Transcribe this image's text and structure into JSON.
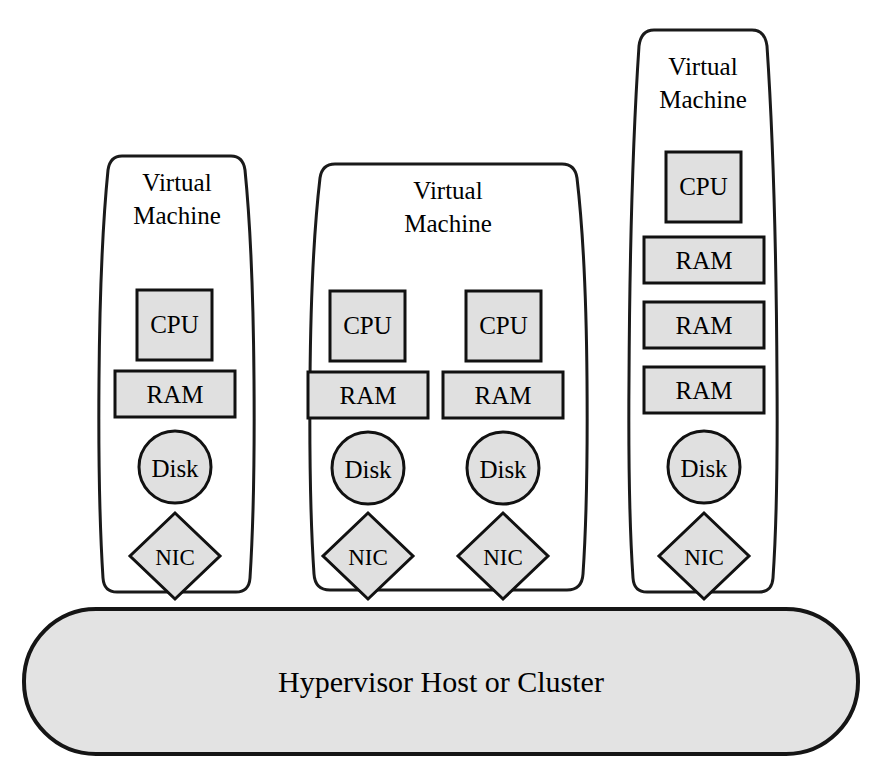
{
  "diagram": {
    "title_text": "Hypervisor Host or Cluster",
    "colors": {
      "component_fill": "#e0e0e0",
      "hypervisor_fill": "#e3e3e3",
      "stroke": "#111111",
      "background": "#ffffff"
    },
    "virtual_machines": [
      {
        "id": "vm-1",
        "title_line1": "Virtual",
        "title_line2": "Machine",
        "columns": [
          {
            "components": [
              {
                "type": "cpu",
                "label": "CPU",
                "shape": "rectangle"
              },
              {
                "type": "ram",
                "label": "RAM",
                "shape": "rectangle"
              },
              {
                "type": "disk",
                "label": "Disk",
                "shape": "circle"
              },
              {
                "type": "nic",
                "label": "NIC",
                "shape": "diamond"
              }
            ]
          }
        ]
      },
      {
        "id": "vm-2",
        "title_line1": "Virtual",
        "title_line2": "Machine",
        "columns": [
          {
            "components": [
              {
                "type": "cpu",
                "label": "CPU",
                "shape": "rectangle"
              },
              {
                "type": "ram",
                "label": "RAM",
                "shape": "rectangle"
              },
              {
                "type": "disk",
                "label": "Disk",
                "shape": "circle"
              },
              {
                "type": "nic",
                "label": "NIC",
                "shape": "diamond"
              }
            ]
          },
          {
            "components": [
              {
                "type": "cpu",
                "label": "CPU",
                "shape": "rectangle"
              },
              {
                "type": "ram",
                "label": "RAM",
                "shape": "rectangle"
              },
              {
                "type": "disk",
                "label": "Disk",
                "shape": "circle"
              },
              {
                "type": "nic",
                "label": "NIC",
                "shape": "diamond"
              }
            ]
          }
        ]
      },
      {
        "id": "vm-3",
        "title_line1": "Virtual",
        "title_line2": "Machine",
        "columns": [
          {
            "components": [
              {
                "type": "cpu",
                "label": "CPU",
                "shape": "rectangle"
              },
              {
                "type": "ram",
                "label": "RAM",
                "shape": "rectangle"
              },
              {
                "type": "ram",
                "label": "RAM",
                "shape": "rectangle"
              },
              {
                "type": "ram",
                "label": "RAM",
                "shape": "rectangle"
              },
              {
                "type": "disk",
                "label": "Disk",
                "shape": "circle"
              },
              {
                "type": "nic",
                "label": "NIC",
                "shape": "diamond"
              }
            ]
          }
        ]
      }
    ],
    "hypervisor": {
      "label": "Hypervisor Host or Cluster"
    }
  }
}
